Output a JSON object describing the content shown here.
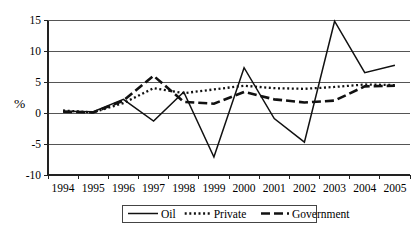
{
  "chart_data": {
    "type": "line",
    "title": "",
    "subtitle": "",
    "xlabel": "",
    "ylabel": "%",
    "categories": [
      "1994",
      "1995",
      "1996",
      "1997",
      "1998",
      "1999",
      "2000",
      "2001",
      "2002",
      "2003",
      "2004",
      "2005"
    ],
    "ylim": [
      -10,
      15
    ],
    "yticks": [
      15,
      10,
      5,
      0,
      -5,
      -10
    ],
    "ytick_labels": [
      "15",
      "10",
      "5",
      "0",
      "-5",
      "-10"
    ],
    "grid": true,
    "grid_axis": "y",
    "legend_position": "below",
    "series": [
      {
        "name": "Oil",
        "style": "solid",
        "color": "#111111",
        "values": [
          0.3,
          0.2,
          2.2,
          -1.3,
          3.4,
          -7.1,
          7.3,
          -0.9,
          -4.7,
          14.8,
          6.5,
          7.7
        ]
      },
      {
        "name": "Private",
        "style": "dotted",
        "color": "#111111",
        "values": [
          0.4,
          0.1,
          1.6,
          4.0,
          3.2,
          3.8,
          4.4,
          4.0,
          3.9,
          4.2,
          4.6,
          4.5
        ]
      },
      {
        "name": "Government",
        "style": "dashed",
        "color": "#111111",
        "values": [
          0.2,
          0.1,
          2.0,
          6.0,
          1.8,
          1.5,
          3.4,
          2.2,
          1.7,
          2.0,
          4.3,
          4.4
        ]
      }
    ]
  },
  "axis": {
    "y_title": "%",
    "y_tick_labels": [
      "15",
      "10",
      "5",
      "0",
      "-5",
      "-10"
    ],
    "x_tick_labels": [
      "1994",
      "1995",
      "1996",
      "1997",
      "1998",
      "1999",
      "2000",
      "2001",
      "2002",
      "2003",
      "2004",
      "2005"
    ]
  },
  "legend": {
    "entries": [
      {
        "label": "Oil",
        "style": "solid"
      },
      {
        "label": "Private",
        "style": "dotted"
      },
      {
        "label": "Government",
        "style": "dashed"
      }
    ]
  }
}
